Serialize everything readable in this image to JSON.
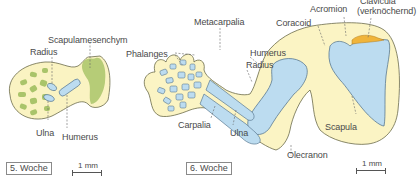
{
  "panels": [
    {
      "id": "week5",
      "week_label": "5. Woche",
      "scale_label": "1 mm",
      "labels": {
        "scapulamesenchym": "Scapulamesenchym",
        "radius": "Radius",
        "ulna": "Ulna",
        "humerus": "Humerus"
      }
    },
    {
      "id": "week6",
      "week_label": "6. Woche",
      "scale_label": "1 mm",
      "labels": {
        "metacarpalia": "Metacarpalia",
        "phalanges": "Phalanges",
        "carpalia": "Carpalia",
        "ulna": "Ulna",
        "radius": "Radius",
        "humerus": "Humerus",
        "coracoid": "Coracoid",
        "acromion": "Acromion",
        "clavicula": "Clavicula",
        "clavicula_note": "(verknöchernd)",
        "scapula": "Scapula",
        "olecranon": "Olecranon"
      }
    }
  ],
  "colors": {
    "mesenchyme_yellow": "#fbf4c4",
    "limb_outline": "#6b6b4a",
    "precartilage_green": "#a9c46a",
    "cartilage_blue": "#bcdcf0",
    "cartilage_outline": "#5a7a92",
    "ossifying_orange": "#f0b43a",
    "label_text": "#4a4a4a"
  }
}
